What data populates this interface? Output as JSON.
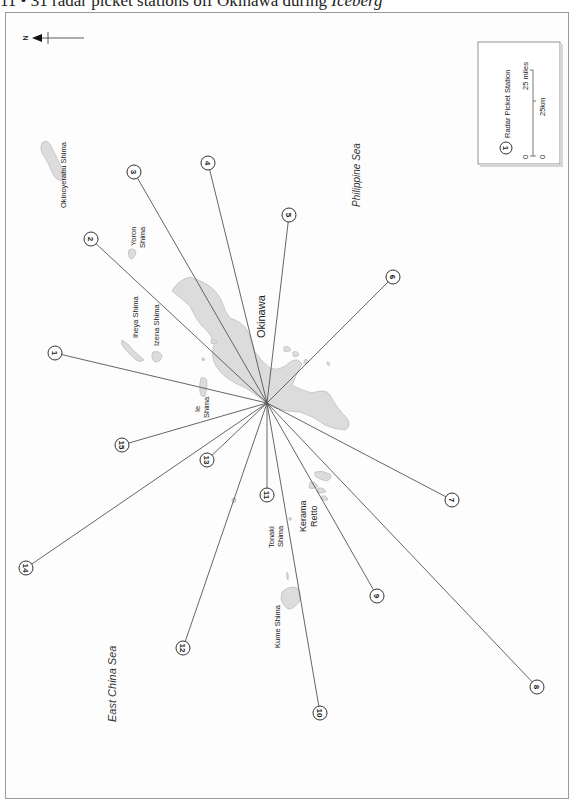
{
  "title": {
    "prefix": "11 • 31 radar picket stations off Okinawa during ",
    "operation": "Iceberg"
  },
  "north_arrow": {
    "label": "N"
  },
  "legend": {
    "station_symbol_number": "1",
    "station_label": "Radar Picket Station",
    "scale_miles_zero": "0",
    "scale_miles_label": "25 miles",
    "scale_km_zero": "0",
    "scale_km_label": "25km"
  },
  "seas": {
    "east": "Philippine Sea",
    "west": "East China Sea"
  },
  "islands": {
    "okinawa": "Okinawa",
    "okinoyerabu": "Okinoyerabu Shima",
    "yoron_1": "Yoron",
    "yoron_2": "Shima",
    "iheya": "Iheya Shima",
    "izena": "Izena Shima",
    "ie_1": "Ie",
    "ie_2": "Shima",
    "tonaki_1": "Tonaki",
    "tonaki_2": "Shima",
    "kerama_1": "Kerama",
    "kerama_2": "Retto",
    "kume": "Kume Shima"
  },
  "center": {
    "x": 267,
    "y": 403
  },
  "stations": [
    {
      "number": "1",
      "x": 55,
      "y": 353
    },
    {
      "number": "2",
      "x": 91,
      "y": 239
    },
    {
      "number": "3",
      "x": 134,
      "y": 172
    },
    {
      "number": "4",
      "x": 208,
      "y": 163
    },
    {
      "number": "5",
      "x": 289,
      "y": 215
    },
    {
      "number": "6",
      "x": 393,
      "y": 277
    },
    {
      "number": "7",
      "x": 452,
      "y": 500
    },
    {
      "number": "8",
      "x": 537,
      "y": 687
    },
    {
      "number": "9",
      "x": 377,
      "y": 596
    },
    {
      "number": "10",
      "x": 320,
      "y": 713
    },
    {
      "number": "11",
      "x": 267,
      "y": 495
    },
    {
      "number": "12",
      "x": 183,
      "y": 648
    },
    {
      "number": "13",
      "x": 207,
      "y": 460
    },
    {
      "number": "14",
      "x": 26,
      "y": 568
    },
    {
      "number": "15",
      "x": 122,
      "y": 445
    }
  ],
  "colors": {
    "land": "#dcdcdc",
    "land_stroke": "#b9b9b9",
    "line": "#555555",
    "frame": "#9a9a9a"
  }
}
